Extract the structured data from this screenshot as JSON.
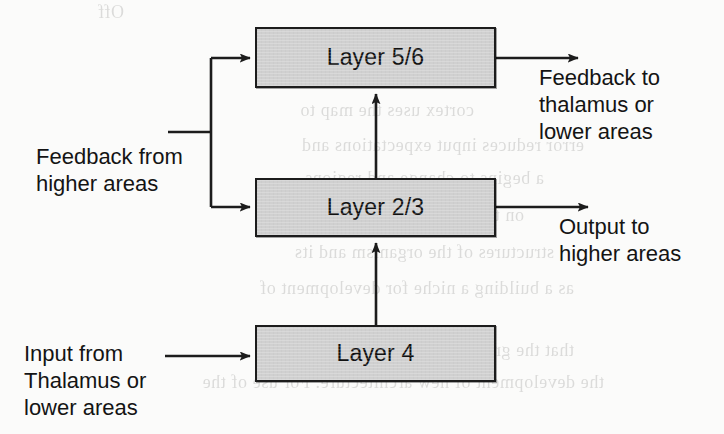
{
  "diagram": {
    "background_color": "#fbfbfa",
    "box_fill_color": "#d0d0d0",
    "box_border_color": "#1c1c1c",
    "text_color": "#141414",
    "boxes": [
      {
        "id": "layer56",
        "label": "Layer 5/6",
        "x": 255,
        "y": 27,
        "w": 241,
        "h": 61
      },
      {
        "id": "layer23",
        "label": "Layer 2/3",
        "x": 255,
        "y": 178,
        "w": 241,
        "h": 59
      },
      {
        "id": "layer4",
        "label": "Layer 4",
        "x": 255,
        "y": 325,
        "w": 241,
        "h": 57
      }
    ],
    "labels": {
      "feedback_to": "Feedback to\nthalamus or\nlower areas",
      "output_to": "Output to\nhigher areas",
      "feedback_from": "Feedback from\nhigher areas",
      "input_from": "Input from\nThalamus or\nlower areas"
    },
    "connections": [
      {
        "id": "feedback-in-trunk",
        "from": "feedback-from-label",
        "to": "branch-node",
        "kind": "line"
      },
      {
        "id": "feedback-to-layer56",
        "from": "branch-node",
        "to": "layer56",
        "kind": "arrow"
      },
      {
        "id": "feedback-to-layer23",
        "from": "branch-node",
        "to": "layer23",
        "kind": "arrow"
      },
      {
        "id": "layer23-to-layer56",
        "from": "layer23",
        "to": "layer56",
        "kind": "arrow"
      },
      {
        "id": "layer4-to-layer23",
        "from": "layer4",
        "to": "layer23",
        "kind": "arrow"
      },
      {
        "id": "layer56-output",
        "from": "layer56",
        "to": "feedback-to-label",
        "kind": "arrow"
      },
      {
        "id": "layer23-output",
        "from": "layer23",
        "to": "output-to-label",
        "kind": "arrow"
      },
      {
        "id": "input-to-layer4",
        "from": "input-from-label",
        "to": "layer4",
        "kind": "arrow"
      }
    ]
  },
  "bleedthrough": {
    "note": "faint mirrored text showing through from the reverse side of the scanned page",
    "lines": [
      {
        "text": "Off",
        "x": 600,
        "y": 2
      },
      {
        "text": "as detail",
        "x": 400,
        "y": 62
      },
      {
        "text": "cortex uses the map to",
        "x": 250,
        "y": 100
      },
      {
        "text": "error reduces input expectations and",
        "x": 140,
        "y": 135
      },
      {
        "text": "a begins to change and regions",
        "x": 180,
        "y": 168
      },
      {
        "text": "on the network for action",
        "x": 200,
        "y": 205
      },
      {
        "text": "structures of the organism and its",
        "x": 170,
        "y": 242
      },
      {
        "text": "as a building a niche for development of",
        "x": 150,
        "y": 278
      },
      {
        "text": "that the graph and the network will need",
        "x": 150,
        "y": 340
      },
      {
        "text": "the development of new architecture. For use of the",
        "x": 120,
        "y": 372
      }
    ]
  }
}
